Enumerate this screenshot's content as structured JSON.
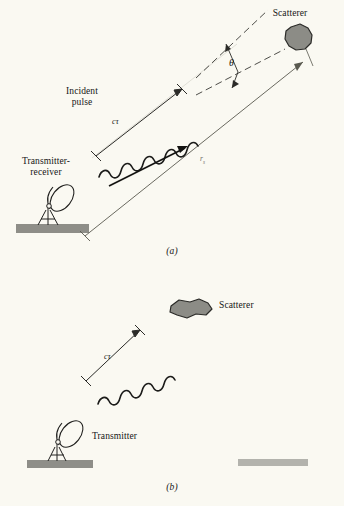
{
  "figure": {
    "background_color": "#faf9f2",
    "ink_color": "#161616",
    "ground_color_left": "#8e8e88",
    "ground_color_right": "#b3b3ad",
    "scatterer_fill": "#8c8c86",
    "scatterer_stroke": "#2b2b28"
  },
  "panel_a": {
    "caption": "(a)",
    "labels": {
      "scatterer": "Scatterer",
      "incident_pulse_line1": "Incident",
      "incident_pulse_line2": "pulse",
      "transmitter_receiver_line1": "Transmitter-",
      "transmitter_receiver_line2": "receiver",
      "pulse_length": "cτ",
      "range": "r",
      "range_subscript": "s",
      "angle": "θ"
    }
  },
  "panel_b": {
    "caption": "(b)",
    "labels": {
      "scatterer": "Scatterer",
      "transmitter": "Transmitter",
      "pulse_length": "cτ"
    }
  }
}
